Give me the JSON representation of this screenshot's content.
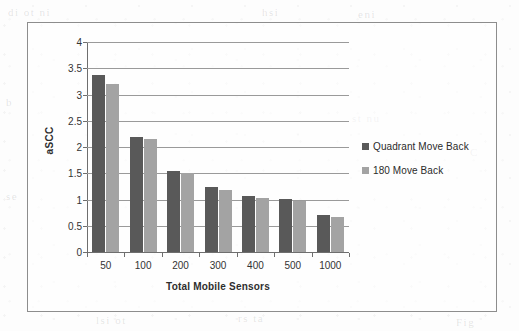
{
  "chart_data": {
    "type": "bar",
    "title": "",
    "xlabel": "Total Mobile Sensors",
    "ylabel": "aSCC",
    "categories": [
      "50",
      "100",
      "200",
      "300",
      "400",
      "500",
      "1000"
    ],
    "series": [
      {
        "name": "Quadrant Move Back",
        "color": "#595959",
        "values": [
          3.37,
          2.2,
          1.55,
          1.23,
          1.07,
          1.01,
          0.7
        ]
      },
      {
        "name": "180 Move Back",
        "color": "#a3a3a3",
        "values": [
          3.2,
          2.15,
          1.5,
          1.19,
          1.02,
          0.97,
          0.66
        ]
      }
    ],
    "ylim": [
      0,
      4
    ],
    "yticks": [
      "0",
      "0.5",
      "1",
      "1.5",
      "2",
      "2.5",
      "3",
      "3.5",
      "4"
    ],
    "ytick_values": [
      0,
      0.5,
      1,
      1.5,
      2,
      2.5,
      3,
      3.5,
      4
    ],
    "grid": true,
    "legend_position": "right"
  },
  "legend": {
    "items": [
      {
        "label": "Quadrant Move Back",
        "swatch": "legend-swatch-quadrant-move-back"
      },
      {
        "label": "180 Move Back",
        "swatch": "legend-swatch-180-move-back"
      }
    ]
  },
  "ghost_text": [
    {
      "text": "di  ot  ni",
      "x": 8,
      "y": 6
    },
    {
      "text": "hsi",
      "x": 262,
      "y": 6
    },
    {
      "text": "eni",
      "x": 358,
      "y": 8
    },
    {
      "text": "b",
      "x": 6,
      "y": 96
    },
    {
      "text": "st  nu",
      "x": 352,
      "y": 112
    },
    {
      "text": "C",
      "x": 470,
      "y": 146
    },
    {
      "text": "se",
      "x": 6,
      "y": 190
    },
    {
      "text": "lsi  ot",
      "x": 96,
      "y": 314
    },
    {
      "text": "rs  ta",
      "x": 238,
      "y": 312
    },
    {
      "text": "Fig",
      "x": 456,
      "y": 316
    }
  ]
}
